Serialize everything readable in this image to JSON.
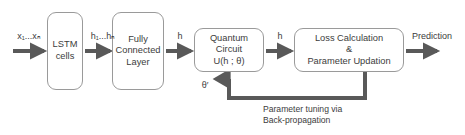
{
  "diagram": {
    "accent_color": "#595959",
    "box_border_color": "#9a9a9a",
    "text_color": "#3c3c3c",
    "background_color": "#ffffff",
    "nodes": [
      {
        "id": "lstm",
        "lines": [
          "LSTM",
          "cells"
        ],
        "x": 47,
        "y": 12,
        "w": 36,
        "h": 78
      },
      {
        "id": "fully-connected",
        "lines": [
          "Fully",
          "Connected",
          "Layer"
        ],
        "x": 112,
        "y": 12,
        "w": 52,
        "h": 78
      },
      {
        "id": "quantum-circuit",
        "lines": [
          "Quantum",
          "Circuit",
          "U(h ; θ)"
        ],
        "x": 194,
        "y": 28,
        "w": 70,
        "h": 44
      },
      {
        "id": "loss-calculation",
        "lines": [
          "Loss Calculation",
          "&",
          "Parameter Updation"
        ],
        "x": 294,
        "y": 28,
        "w": 110,
        "h": 44
      }
    ],
    "edge_labels": [
      {
        "id": "input-label",
        "text": "x₁...xₙ",
        "x": 12,
        "y": 31,
        "w": 34
      },
      {
        "id": "hidden-states-label",
        "text": "h₁...hₙ",
        "x": 86,
        "y": 31,
        "w": 34
      },
      {
        "id": "h-label-1",
        "text": "h",
        "x": 168,
        "y": 31,
        "w": 24
      },
      {
        "id": "h-label-2",
        "text": "h",
        "x": 268,
        "y": 31,
        "w": 24
      },
      {
        "id": "theta-prime-label",
        "text": "θ′",
        "x": 196,
        "y": 80,
        "w": 18
      },
      {
        "id": "prediction-label",
        "text": "Prediction",
        "x": 404,
        "y": 31,
        "w": 56
      }
    ],
    "caption": {
      "id": "feedback-caption",
      "line1": "Parameter tuning via",
      "line2": "Back-propagation",
      "x": 263,
      "y": 104
    },
    "arrows": [
      {
        "id": "arrow-input-to-lstm",
        "from": "input",
        "to": "lstm"
      },
      {
        "id": "arrow-lstm-to-fc",
        "from": "lstm",
        "to": "fully-connected"
      },
      {
        "id": "arrow-fc-to-quantum",
        "from": "fully-connected",
        "to": "quantum-circuit"
      },
      {
        "id": "arrow-quantum-to-loss",
        "from": "quantum-circuit",
        "to": "loss-calculation"
      },
      {
        "id": "arrow-loss-to-prediction",
        "from": "loss-calculation",
        "to": "prediction"
      },
      {
        "id": "arrow-feedback-loop",
        "from": "loss-calculation",
        "to": "quantum-circuit"
      }
    ]
  }
}
